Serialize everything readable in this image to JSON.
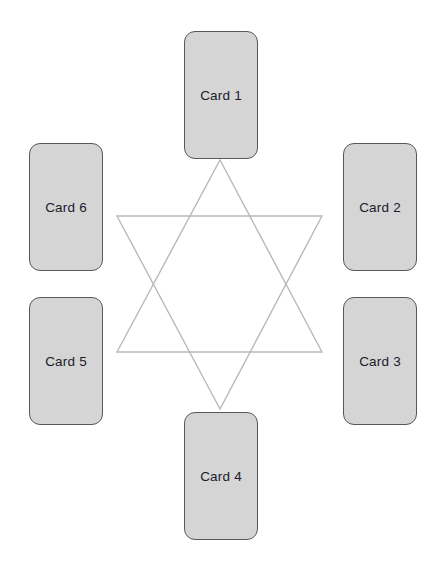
{
  "canvas": {
    "width": 436,
    "height": 570,
    "background": "#ffffff"
  },
  "figure": {
    "name": "hexagram-card-layout"
  },
  "colors": {
    "card_fill": "#d5d5d5",
    "card_border": "#585858",
    "card_text": "#1b1b2b",
    "star_stroke": "#b9b9b9",
    "background": "#ffffff"
  },
  "star": {
    "name": "hexagram",
    "stroke": "#b9b9b9",
    "stroke_width": 1.4,
    "fill": "none",
    "center_x": 220,
    "center_y": 284,
    "up_triangle_points": "220,160 322,352 117,352",
    "down_triangle_points": "220,409 117,216 322,216"
  },
  "cards": [
    {
      "id": "card-1",
      "label": "Card 1",
      "x": 184,
      "y": 31,
      "width": 74,
      "height": 128,
      "position": "top"
    },
    {
      "id": "card-2",
      "label": "Card 2",
      "x": 343,
      "y": 143,
      "width": 74,
      "height": 128,
      "position": "upper-right"
    },
    {
      "id": "card-3",
      "label": "Card 3",
      "x": 343,
      "y": 297,
      "width": 74,
      "height": 128,
      "position": "lower-right"
    },
    {
      "id": "card-4",
      "label": "Card 4",
      "x": 184,
      "y": 412,
      "width": 74,
      "height": 128,
      "position": "bottom"
    },
    {
      "id": "card-5",
      "label": "Card 5",
      "x": 29,
      "y": 297,
      "width": 74,
      "height": 128,
      "position": "lower-left"
    },
    {
      "id": "card-6",
      "label": "Card 6",
      "x": 29,
      "y": 143,
      "width": 74,
      "height": 128,
      "position": "upper-left"
    }
  ]
}
